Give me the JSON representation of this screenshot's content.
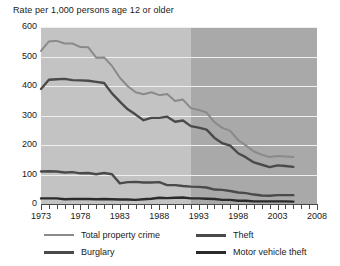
{
  "chart_data": {
    "type": "line",
    "title": "Rate per 1,000 persons age 12 or older",
    "xlabel": "",
    "ylabel": "Rate per 1,000 persons age 12 or older",
    "xlim": [
      1973,
      2008
    ],
    "ylim": [
      0,
      600
    ],
    "ytick_labels": [
      "600",
      "500",
      "400",
      "300",
      "200",
      "100",
      "0"
    ],
    "ytick_values": [
      600,
      500,
      400,
      300,
      200,
      100,
      0
    ],
    "xtick_labels": [
      "1973",
      "1978",
      "1983",
      "1988",
      "1993",
      "1998",
      "2003",
      "2008"
    ],
    "xtick_values": [
      1973,
      1978,
      1983,
      1988,
      1993,
      1998,
      2003,
      2008
    ],
    "grid": "horizontal",
    "legend_position": "below",
    "shaded_region": {
      "from": 1992,
      "to": 2008,
      "note": "darker background band"
    },
    "x": [
      1973,
      1974,
      1975,
      1976,
      1977,
      1978,
      1979,
      1980,
      1981,
      1982,
      1983,
      1984,
      1985,
      1986,
      1987,
      1988,
      1989,
      1990,
      1991,
      1992,
      1993,
      1994,
      1995,
      1996,
      1997,
      1998,
      1999,
      2000,
      2001,
      2002,
      2003,
      2004,
      2005
    ],
    "series": [
      {
        "name": "Total property crime",
        "color": "#8a8a8a",
        "values": [
          519,
          551,
          553,
          544,
          544,
          532,
          531,
          496,
          497,
          468,
          428,
          399,
          379,
          372,
          379,
          369,
          373,
          349,
          354,
          325,
          319,
          310,
          277,
          258,
          248,
          217,
          198,
          178,
          167,
          159,
          163,
          161,
          159
        ]
      },
      {
        "name": "Theft",
        "color": "#4a4a4a",
        "values": [
          390,
          421,
          423,
          424,
          420,
          419,
          418,
          414,
          410,
          375,
          347,
          321,
          303,
          284,
          292,
          292,
          296,
          279,
          283,
          264,
          259,
          252,
          224,
          206,
          198,
          172,
          158,
          141,
          133,
          125,
          131,
          129,
          126
        ]
      },
      {
        "name": "Burglary",
        "color": "#4a4a4a",
        "values": [
          110,
          111,
          110,
          107,
          108,
          104,
          105,
          101,
          105,
          101,
          70,
          74,
          75,
          73,
          73,
          74,
          64,
          64,
          61,
          59,
          58,
          56,
          49,
          48,
          44,
          39,
          37,
          32,
          29,
          28,
          30,
          30,
          30
        ]
      },
      {
        "name": "Motor vehicle theft",
        "color": "#2b2b2b",
        "values": [
          19,
          19,
          19,
          16,
          17,
          17,
          17,
          16,
          17,
          16,
          15,
          15,
          14,
          16,
          18,
          21,
          20,
          21,
          22,
          19,
          19,
          18,
          17,
          14,
          14,
          11,
          11,
          9,
          9,
          9,
          9,
          9,
          8
        ]
      }
    ]
  },
  "legend": {
    "items": [
      {
        "label": "Total property crime",
        "color": "#8a8a8a",
        "width": 2
      },
      {
        "label": "Theft",
        "color": "#4a4a4a",
        "width": 3
      },
      {
        "label": "Burglary",
        "color": "#4a4a4a",
        "width": 3
      },
      {
        "label": "Motor vehicle theft",
        "color": "#2b2b2b",
        "width": 3
      }
    ]
  }
}
